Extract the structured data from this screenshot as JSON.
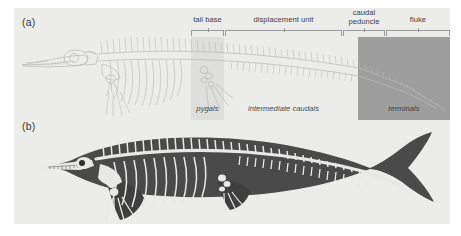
{
  "figure": {
    "panels": [
      {
        "id": "a",
        "label": "(a)",
        "caption_style": "skeleton-outline"
      },
      {
        "id": "b",
        "label": "(b)",
        "caption_style": "body-silhouette"
      }
    ]
  },
  "regions": {
    "top_labels": [
      {
        "name": "tail-base",
        "text": "tail base",
        "left": 177,
        "width": 33,
        "lines": 1
      },
      {
        "name": "displacement-unit",
        "text": "displacement unit",
        "left": 211,
        "width": 117,
        "lines": 1
      },
      {
        "name": "caudal-peduncle",
        "text": "caudal\npeduncle",
        "left": 329,
        "width": 42,
        "lines": 2
      },
      {
        "name": "fluke",
        "text": "fluke",
        "left": 372,
        "width": 64,
        "lines": 1
      }
    ],
    "bottom_labels": [
      {
        "name": "pygals",
        "text": "pygals",
        "left": 177,
        "width": 33
      },
      {
        "name": "intermediate-caudals",
        "text": "intermediate caudals",
        "left": 211,
        "width": 117
      },
      {
        "name": "terminals",
        "text": "terminals",
        "left": 344,
        "width": 92
      }
    ]
  },
  "colors": {
    "plate_background": "#ececeb",
    "page_background": "#ffffff",
    "band_tail_base": "#dededd",
    "band_fluke": "#9e9e9e",
    "bracket_line": "#9a9a9a",
    "label_text": "#404040",
    "skeleton_line": "#b9b9b7",
    "body_silhouette": "#4a4a4a",
    "bone_light": "#e8e8e6"
  }
}
